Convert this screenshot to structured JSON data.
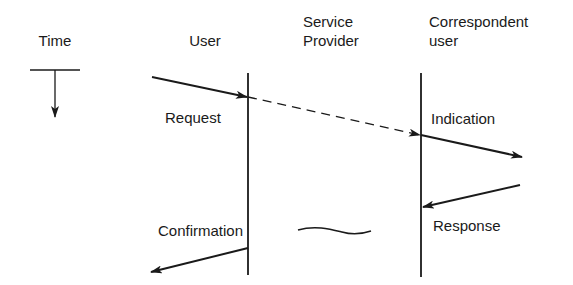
{
  "diagram": {
    "type": "time-sequence",
    "time_axis": {
      "label": "Time",
      "direction": "down"
    },
    "columns": [
      {
        "id": "user",
        "label": "User"
      },
      {
        "id": "service_provider",
        "label_line1": "Service",
        "label_line2": "Provider"
      },
      {
        "id": "correspondent",
        "label_line1": "Correspondent",
        "label_line2": "user"
      }
    ],
    "primitives": [
      {
        "label": "Request",
        "from": "User",
        "to": "Service Provider"
      },
      {
        "label": "Indication",
        "from": "Service Provider",
        "to": "Correspondent user"
      },
      {
        "label": "Response",
        "from": "Correspondent user",
        "to": "Service Provider"
      },
      {
        "label": "Confirmation",
        "from": "Service Provider",
        "to": "User"
      }
    ],
    "colors": {
      "line": "#1a1a1a",
      "background": "#ffffff"
    }
  }
}
